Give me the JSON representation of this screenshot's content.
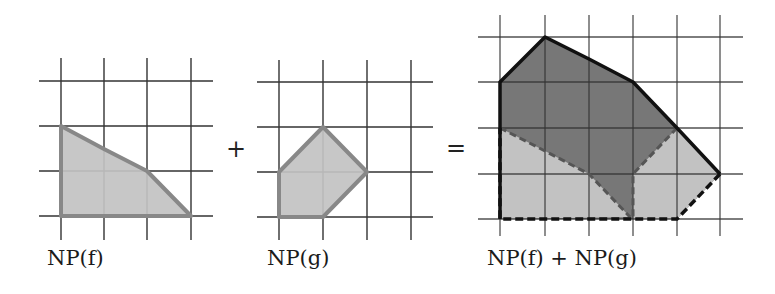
{
  "figure": {
    "operator_plus": "+",
    "operator_equals": "=",
    "labels": {
      "np_f": "NP(f)",
      "np_g": "NP(g)",
      "np_sum": "NP(f) + NP(g)"
    }
  },
  "colors": {
    "grid": "#333333",
    "light_fill": "#c2c2c2",
    "dark_fill": "#777777",
    "summand_outline": "#888888",
    "sum_outline": "#111111",
    "dashed_outline": "#555555"
  },
  "panels": [
    {
      "id": "np_f",
      "grid_points": "lattice 4x4",
      "vertices": [
        [
          0,
          2
        ],
        [
          2,
          1
        ],
        [
          3,
          0
        ],
        [
          0,
          0
        ]
      ]
    },
    {
      "id": "np_g",
      "grid_points": "lattice 4x4",
      "vertices": [
        [
          0,
          1
        ],
        [
          1,
          2
        ],
        [
          2,
          1
        ],
        [
          1,
          0
        ],
        [
          0,
          0
        ]
      ]
    },
    {
      "id": "np_sum",
      "grid_points": "lattice 6x5",
      "vertices": [
        [
          0,
          3
        ],
        [
          1,
          4
        ],
        [
          3,
          3
        ],
        [
          4,
          2
        ],
        [
          5,
          1
        ],
        [
          4,
          0
        ],
        [
          0,
          0
        ]
      ],
      "translated_copies": [
        {
          "of": "np_f",
          "vertices": [
            [
              0,
              2
            ],
            [
              2,
              1
            ],
            [
              3,
              0
            ],
            [
              0,
              0
            ]
          ]
        },
        {
          "of": "np_g",
          "vertices": [
            [
              3,
              1
            ],
            [
              4,
              2
            ],
            [
              5,
              1
            ],
            [
              4,
              0
            ],
            [
              3,
              0
            ]
          ]
        }
      ]
    }
  ]
}
